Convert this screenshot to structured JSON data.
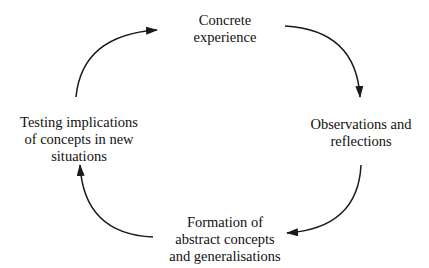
{
  "diagram": {
    "type": "cycle",
    "title": "",
    "nodes": [
      {
        "id": "concrete",
        "lines": [
          "Concrete",
          "experience"
        ]
      },
      {
        "id": "observations",
        "lines": [
          "Observations and",
          "reflections"
        ]
      },
      {
        "id": "formation",
        "lines": [
          "Formation of",
          "abstract concepts",
          "and generalisations"
        ]
      },
      {
        "id": "testing",
        "lines": [
          "Testing implications",
          "of concepts in new",
          "situations"
        ]
      }
    ],
    "edges": [
      {
        "from": "concrete",
        "to": "observations"
      },
      {
        "from": "observations",
        "to": "formation"
      },
      {
        "from": "formation",
        "to": "testing"
      },
      {
        "from": "testing",
        "to": "concrete"
      }
    ],
    "colors": {
      "stroke": "#1a1a1a",
      "text": "#111111",
      "background": "#ffffff"
    }
  }
}
